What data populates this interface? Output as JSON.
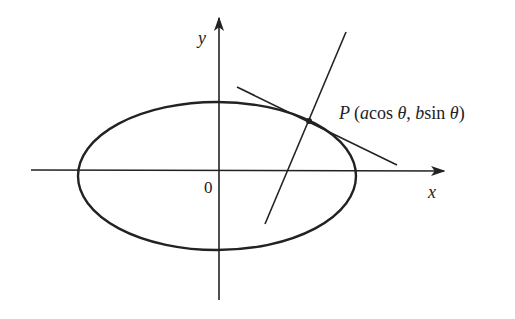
{
  "diagram": {
    "type": "ellipse with tangent and normal",
    "axes": {
      "x_label": "x",
      "y_label": "y",
      "origin_label": "0"
    },
    "point": {
      "name": "P",
      "coords_open": "(",
      "coord_a": "a",
      "coord_cos": "cos ",
      "theta1": "θ",
      "comma": ", ",
      "coord_b": "b",
      "coord_sin": "sin ",
      "theta2": "θ",
      "coords_close": ")"
    },
    "colors": {
      "stroke": "#222222",
      "background": "#ffffff"
    }
  }
}
